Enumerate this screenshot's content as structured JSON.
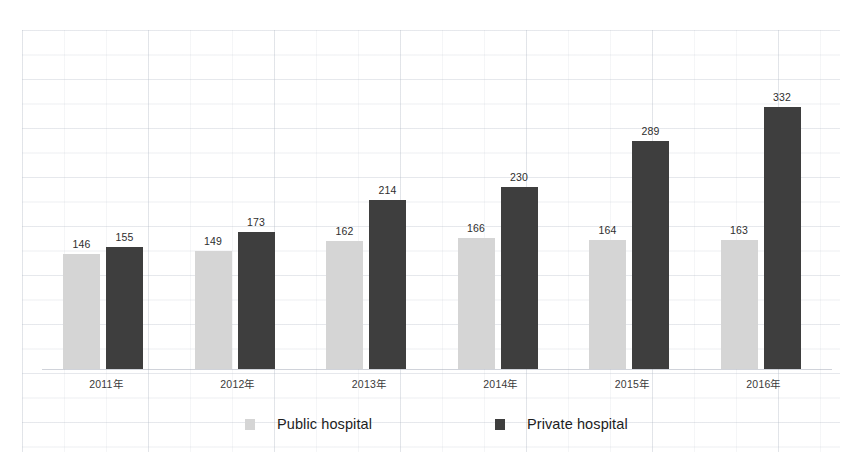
{
  "chart_data": {
    "type": "bar",
    "title": "",
    "subtitle": "",
    "xlabel": "",
    "ylabel": "",
    "categories": [
      "2011年",
      "2012年",
      "2013年",
      "2014年",
      "2015年",
      "2016年"
    ],
    "series": [
      {
        "name": "Public hospital",
        "color": "#d5d5d5",
        "values": [
          146,
          149,
          162,
          166,
          164,
          163
        ]
      },
      {
        "name": "Private hospital",
        "color": "#3e3e3e",
        "values": [
          155,
          173,
          214,
          230,
          289,
          332
        ]
      }
    ],
    "ylim": [
      0,
      360
    ],
    "grid": true,
    "grid_style": "faint-scanned-graph-paper",
    "legend_position": "bottom",
    "data_labels_shown": true,
    "axis_line": "baseline-only"
  },
  "legend": {
    "items": [
      {
        "label": "Public hospital",
        "swatch": "legend-swatch-light-gray"
      },
      {
        "label": "Private hospital",
        "swatch": "legend-swatch-dark-gray"
      }
    ]
  },
  "colors": {
    "public": "#d5d5d5",
    "private": "#3e3e3e",
    "background": "#ffffff",
    "label_text": "#2e2e2e",
    "grid": "#a0aab9"
  }
}
